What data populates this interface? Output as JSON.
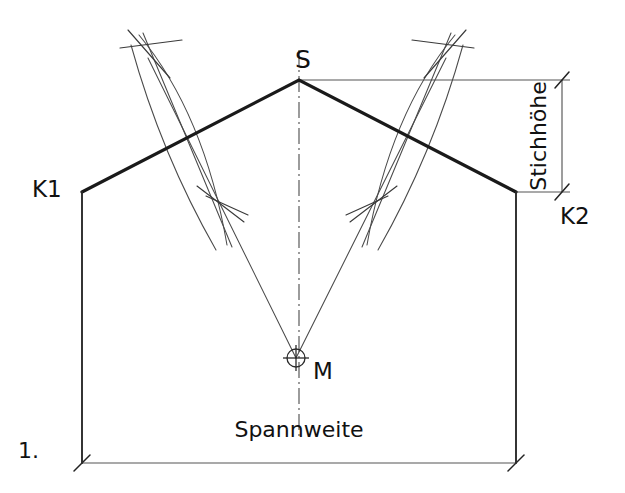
{
  "figure": {
    "number_label": "1.",
    "background_color": "#ffffff",
    "ink_color": "#1a1a1a",
    "construction_color": "#4a4a4a",
    "dimension_color": "#555555"
  },
  "labels": {
    "apex": "S",
    "left_corner": "K1",
    "right_corner": "K2",
    "center": "M",
    "span_dimension": "Spannweite",
    "rise_dimension": "Stichhöhe"
  },
  "geometry": {
    "apex_point": {
      "x": 299,
      "y": 80
    },
    "left_corner_point": {
      "x": 82,
      "y": 192
    },
    "right_corner_point": {
      "x": 516,
      "y": 192
    },
    "center_point": {
      "x": 296,
      "y": 358
    },
    "base_left": {
      "x": 82,
      "y": 463
    },
    "base_right": {
      "x": 516,
      "y": 463
    },
    "left_bisector_upper": {
      "x": 148,
      "y": 58
    },
    "left_bisector_lower": {
      "x": 222,
      "y": 208
    },
    "right_bisector_upper": {
      "x": 446,
      "y": 58
    },
    "right_bisector_lower": {
      "x": 374,
      "y": 207
    },
    "centerline_x": 299,
    "rise_dim_x": 562,
    "rise_top_y": 80,
    "rise_bottom_y": 192,
    "span_dim_y": 463
  }
}
